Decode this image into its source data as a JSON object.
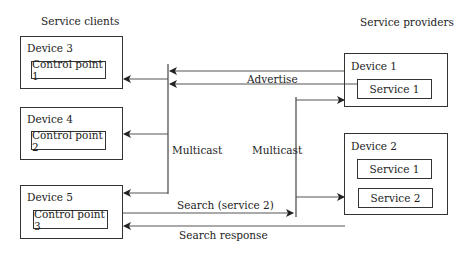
{
  "headers": {
    "clients": "Service clients",
    "providers": "Service providers"
  },
  "clients": [
    {
      "device": "Device 3",
      "component": "Control point 1"
    },
    {
      "device": "Device 4",
      "component": "Control point 2"
    },
    {
      "device": "Device 5",
      "component": "Control point 3"
    }
  ],
  "providers": [
    {
      "device": "Device 1",
      "services": [
        "Service 1"
      ]
    },
    {
      "device": "Device 2",
      "services": [
        "Service 1",
        "Service 2"
      ]
    }
  ],
  "labels": {
    "advertise": "Advertise",
    "multicast_left": "Multicast",
    "multicast_right": "Multicast",
    "search": "Search (service 2)",
    "search_response": "Search response"
  }
}
